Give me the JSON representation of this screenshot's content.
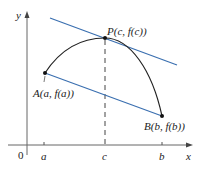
{
  "figure": {
    "axes": {
      "x_label": "x",
      "y_label": "y",
      "origin_label": "0",
      "ticks": [
        {
          "label": "a",
          "x": 44
        },
        {
          "label": "c",
          "x": 105
        },
        {
          "label": "b",
          "x": 162
        }
      ]
    },
    "points": {
      "A": {
        "label": "A(a, f(a))",
        "x": 45,
        "y": 73
      },
      "P": {
        "label": "P(c, f(c))",
        "x": 105,
        "y": 38
      },
      "B": {
        "label": "B(b, f(b))",
        "x": 162,
        "y": 116
      }
    },
    "colors": {
      "curve": "#222222",
      "secant": "#3a6fb0",
      "tangent": "#3a6fb0",
      "axes": "#555555",
      "dashed": "#444444"
    }
  }
}
